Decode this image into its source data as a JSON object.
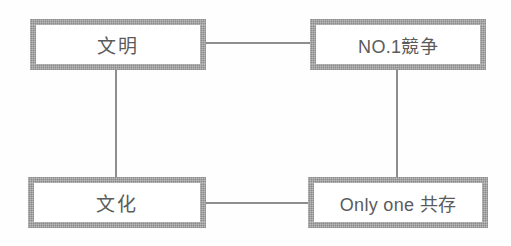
{
  "diagram": {
    "type": "concept-matrix",
    "background_color": "#fefefe",
    "box_border_color": "#8b8b8b",
    "line_color": "#8e8e8e",
    "text_color": "#5b5b5b",
    "nodes": [
      {
        "id": "bunmei",
        "label": "文明",
        "position": "top-left"
      },
      {
        "id": "no1kyoso",
        "label": "NO.1競争",
        "position": "top-right"
      },
      {
        "id": "bunka",
        "label": "文化",
        "position": "bottom-left"
      },
      {
        "id": "onlyone",
        "label": "Only one 共存",
        "position": "bottom-right"
      }
    ],
    "edges": [
      {
        "id": "bunmei-no1",
        "from": "bunmei",
        "to": "no1kyoso",
        "orientation": "horizontal"
      },
      {
        "id": "bunmei-bunka",
        "from": "bunmei",
        "to": "bunka",
        "orientation": "vertical"
      },
      {
        "id": "no1-onlyone",
        "from": "no1kyoso",
        "to": "onlyone",
        "orientation": "vertical"
      },
      {
        "id": "bunka-onlyone",
        "from": "bunka",
        "to": "onlyone",
        "orientation": "horizontal"
      }
    ]
  }
}
